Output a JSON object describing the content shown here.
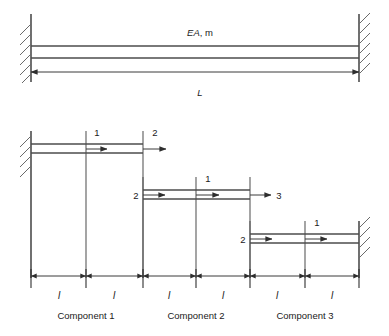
{
  "figure": {
    "top_diagram": {
      "bar_label": "EA, m",
      "bar_label_em": "EA",
      "bar_label_rest": ", m",
      "length_label": "L",
      "left_support": "fixed-support-hatched",
      "right_support": "fixed-support-hatched"
    },
    "components": [
      {
        "name": "Component 1",
        "nodes": [
          {
            "label": "1",
            "position": "mid"
          },
          {
            "label": "2",
            "position": "right"
          }
        ],
        "dof_arrows": 2
      },
      {
        "name": "Component 2",
        "nodes": [
          {
            "label": "2",
            "position": "left"
          },
          {
            "label": "1",
            "position": "mid"
          },
          {
            "label": "3",
            "position": "right"
          }
        ],
        "dof_arrows": 3
      },
      {
        "name": "Component 3",
        "nodes": [
          {
            "label": "2",
            "position": "left"
          },
          {
            "label": "1",
            "position": "mid"
          }
        ],
        "dof_arrows": 2
      }
    ],
    "dimension_segments": [
      {
        "label": "l"
      },
      {
        "label": "l"
      },
      {
        "label": "l"
      },
      {
        "label": "l"
      },
      {
        "label": "l"
      },
      {
        "label": "l"
      }
    ],
    "colors": {
      "line": "#4d4d4d",
      "hatch": "#6a6a6a",
      "dimension": "#2e2e2e",
      "text": "#1a1a1a",
      "background": "#ffffff"
    }
  }
}
